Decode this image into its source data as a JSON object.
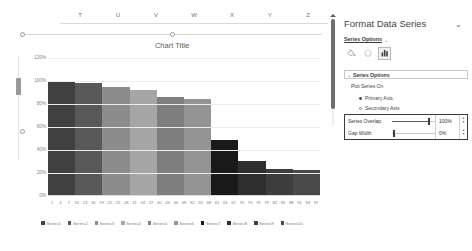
{
  "worksheet": {
    "column_headers": [
      "T",
      "U",
      "V",
      "W",
      "X",
      "Y",
      "Z"
    ]
  },
  "chart": {
    "title": "Chart Title"
  },
  "chart_data": {
    "type": "bar",
    "title": "Chart Title",
    "xlabel": "",
    "ylabel": "",
    "ylim": [
      0,
      120
    ],
    "ytick_labels": [
      "120%",
      "100%",
      "80%",
      "60%",
      "40%",
      "20%",
      "0%"
    ],
    "ytick_values": [
      120,
      100,
      80,
      60,
      40,
      20,
      0
    ],
    "grid": true,
    "legend_position": "bottom",
    "categories": [
      "1",
      "4",
      "7",
      "10",
      "13",
      "16",
      "19",
      "22",
      "25",
      "28",
      "31",
      "34",
      "37",
      "40",
      "43",
      "46",
      "49",
      "52",
      "55",
      "58",
      "61",
      "64",
      "67",
      "70",
      "73",
      "76",
      "79",
      "82",
      "85",
      "88",
      "91",
      "94",
      "97"
    ],
    "series": [
      {
        "name": "Series1",
        "value": 100,
        "color": "#404040"
      },
      {
        "name": "Series2",
        "value": 98,
        "color": "#595959"
      },
      {
        "name": "Series3",
        "value": 95,
        "color": "#8c8c8c"
      },
      {
        "name": "Series4",
        "value": 92,
        "color": "#a6a6a6"
      },
      {
        "name": "Series5",
        "value": 86,
        "color": "#7f7f7f"
      },
      {
        "name": "Series6",
        "value": 84,
        "color": "#949494"
      },
      {
        "name": "Series7",
        "value": 48,
        "color": "#1a1a1a"
      },
      {
        "name": "Series8",
        "value": 30,
        "color": "#2e2e2e"
      },
      {
        "name": "Series9",
        "value": 23,
        "color": "#3d3d3d"
      },
      {
        "name": "Series10",
        "value": 22,
        "color": "#4a4a4a"
      }
    ]
  },
  "pane": {
    "title": "Format Data Series",
    "collapse_icon": "chevron-down-icon",
    "tab_label": "Series Options",
    "tab_caret": "⌄",
    "icons": [
      {
        "name": "fill-and-line-icon",
        "glyph": "paint-bucket",
        "selected": false
      },
      {
        "name": "effects-icon",
        "glyph": "pentagon",
        "selected": false
      },
      {
        "name": "series-options-icon",
        "glyph": "bar-chart",
        "selected": true
      }
    ],
    "section": {
      "caret": "⌄",
      "header": "Series Options",
      "plot_series_on_label": "Plot Series On",
      "radios": [
        {
          "label": "Primary Axis",
          "accel": "P",
          "selected": true
        },
        {
          "label": "Secondary Axis",
          "accel": "S",
          "selected": false
        }
      ],
      "sliders": [
        {
          "label": "Series Overlap",
          "accel": "",
          "value": "100%",
          "percent": 100
        },
        {
          "label": "Gap Width",
          "accel": "W",
          "value": "0%",
          "percent": 0
        }
      ]
    }
  }
}
